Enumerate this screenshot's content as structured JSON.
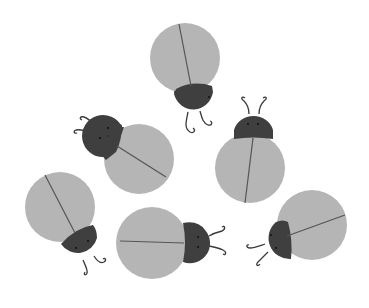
{
  "scene": {
    "title": "Gray ladybugs illustration",
    "background": "#ffffff",
    "colors": {
      "shell": "#b5b5b5",
      "head": "#3f3f3f",
      "line": "#555555",
      "eye": "#111111"
    },
    "bug_count": 6
  },
  "bugs": [
    {
      "name": "bug-top",
      "shell": [
        185,
        58,
        35
      ],
      "head": [
        193,
        96,
        20
      ],
      "heading_deg": 180
    },
    {
      "name": "bug-left-middle",
      "shell": [
        139,
        159,
        35
      ],
      "head": [
        106,
        137,
        20
      ],
      "heading_deg": -56
    },
    {
      "name": "bug-right-middle",
      "shell": [
        250,
        168,
        35
      ],
      "head": [
        254,
        127,
        19
      ],
      "heading_deg": 5
    },
    {
      "name": "bug-bottom-left",
      "shell": [
        60,
        207,
        35
      ],
      "head": [
        80,
        243,
        20
      ],
      "heading_deg": 150
    },
    {
      "name": "bug-bottom-middle",
      "shell": [
        152,
        243,
        36
      ],
      "head": [
        194,
        242,
        20
      ],
      "heading_deg": 90
    },
    {
      "name": "bug-bottom-right",
      "shell": [
        312,
        225,
        35
      ],
      "head": [
        277,
        240,
        20
      ],
      "heading_deg": -112
    }
  ]
}
